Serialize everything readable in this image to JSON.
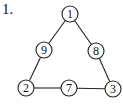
{
  "problem": {
    "label": "1."
  },
  "diagram": {
    "type": "number-triangle",
    "nodes": [
      {
        "id": "top",
        "value": "1",
        "x": 70,
        "y": 14
      },
      {
        "id": "left-mid",
        "value": "9",
        "x": 44,
        "y": 50
      },
      {
        "id": "right-mid",
        "value": "8",
        "x": 96,
        "y": 51
      },
      {
        "id": "bottom-left",
        "value": "2",
        "x": 26,
        "y": 88
      },
      {
        "id": "bottom-mid",
        "value": "7",
        "x": 69,
        "y": 88
      },
      {
        "id": "bottom-right",
        "value": "3",
        "x": 113,
        "y": 89
      }
    ],
    "edges": [
      [
        "top",
        "left-mid"
      ],
      [
        "left-mid",
        "bottom-left"
      ],
      [
        "top",
        "right-mid"
      ],
      [
        "right-mid",
        "bottom-right"
      ],
      [
        "bottom-left",
        "bottom-mid"
      ],
      [
        "bottom-mid",
        "bottom-right"
      ]
    ],
    "node_radius": 8,
    "stroke_color": "#222222"
  }
}
